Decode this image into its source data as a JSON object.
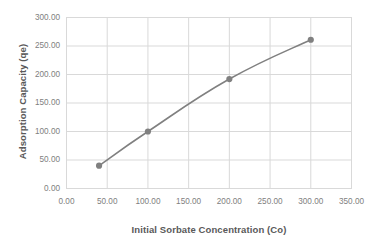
{
  "chart_data": {
    "type": "line",
    "title": "",
    "subtitle": "",
    "xlabel": "Initial Sorbate Concentration (Co)",
    "ylabel": "Adsorption Capacity (qe)",
    "x": [
      40,
      100,
      200,
      300
    ],
    "values": [
      40,
      100,
      192,
      261
    ],
    "series": [
      {
        "name": "",
        "x": [
          40,
          100,
          200,
          300
        ],
        "values": [
          40,
          100,
          192,
          261
        ],
        "line_color": "#808080",
        "marker": "circle",
        "marker_color": "#808080"
      }
    ],
    "xlim": [
      0,
      350
    ],
    "ylim": [
      0,
      300
    ],
    "xticks": [
      0,
      50,
      100,
      150,
      200,
      250,
      300,
      350
    ],
    "yticks": [
      0,
      50,
      100,
      150,
      200,
      250,
      300
    ],
    "xtick_labels": [
      "0.00",
      "50.00",
      "100.00",
      "150.00",
      "200.00",
      "250.00",
      "300.00",
      "350.00"
    ],
    "ytick_labels": [
      "0.00",
      "50.00",
      "100.00",
      "150.00",
      "200.00",
      "250.00",
      "300.00"
    ],
    "grid": true,
    "grid_axis": "both",
    "legend": false,
    "legend_position": "none",
    "plot_border": true,
    "colors": {
      "background": "#ffffff",
      "grid": "#d9d9d9",
      "border": "#d9d9d9",
      "tick_text": "#808080",
      "axis_title_text": "#595959",
      "line": "#808080",
      "marker": "#808080"
    }
  }
}
